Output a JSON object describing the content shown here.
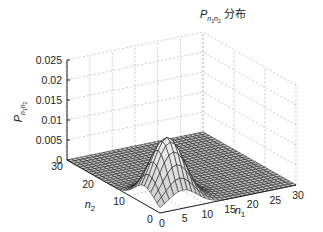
{
  "chart_data": {
    "type": "surface3d",
    "title_parts": {
      "symbol": "P",
      "subscript": "n1n2",
      "suffix": "分布"
    },
    "xlabel": "n1",
    "ylabel": "n2",
    "zlabel": "P_{n1n2}",
    "xlim": [
      0,
      30
    ],
    "ylim": [
      0,
      30
    ],
    "zlim": [
      0,
      0.025
    ],
    "x_ticks": [
      "0",
      "5",
      "10",
      "15",
      "20",
      "25",
      "30"
    ],
    "y_ticks": [
      "0",
      "10",
      "20",
      "30"
    ],
    "z_ticks": [
      "0",
      "0.005",
      "0.01",
      "0.015",
      "0.02",
      "0.025"
    ],
    "grid": true,
    "surface": {
      "shape": "2D Gaussian-like peak",
      "peak_n1": 5,
      "peak_n2": 5,
      "peak_value": 0.0155,
      "spread": 3.2,
      "mesh_step": 1,
      "face_color": "#d9d9d9",
      "edge_color": "#111111"
    }
  },
  "colors": {
    "axis": "#222222",
    "grid": "#bbbbbb",
    "mesh_edge": "#111111",
    "mesh_face": "#dcdcdc"
  }
}
